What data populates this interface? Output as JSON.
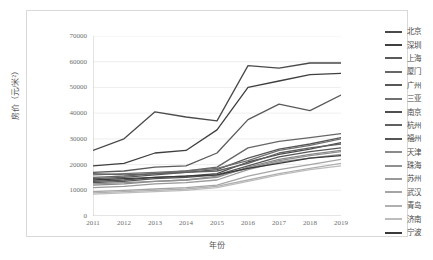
{
  "chart_data": {
    "type": "line",
    "title": "",
    "xlabel": "年份",
    "ylabel": "房价（元/米²）",
    "x": [
      "2011",
      "2012",
      "2013",
      "2014",
      "2015",
      "2016",
      "2017",
      "2018",
      "2019"
    ],
    "xlim": [
      2011,
      2019
    ],
    "ylim": [
      0,
      70000
    ],
    "ytick_labels": [
      "0",
      "10000",
      "20000",
      "30000",
      "40000",
      "50000",
      "60000",
      "70000"
    ],
    "ytick_values": [
      0,
      10000,
      20000,
      30000,
      40000,
      50000,
      60000,
      70000
    ],
    "grid": "horizontal",
    "legend_position": "right",
    "series": [
      {
        "name": "北京",
        "color": "#4a4a4a",
        "values": [
          25500,
          30000,
          40500,
          38500,
          37000,
          58500,
          57500,
          59500,
          59500
        ]
      },
      {
        "name": "深圳",
        "color": "#3f3f3f",
        "values": [
          19500,
          20500,
          24500,
          25500,
          33500,
          50000,
          52500,
          55000,
          55500
        ]
      },
      {
        "name": "上海",
        "color": "#5a5a5a",
        "values": [
          17000,
          17500,
          19000,
          19500,
          24500,
          37500,
          43500,
          41000,
          47000
        ]
      },
      {
        "name": "厦门",
        "color": "#666666",
        "values": [
          15000,
          15500,
          16500,
          17500,
          19000,
          26500,
          29000,
          30500,
          32000
        ]
      },
      {
        "name": "广州",
        "color": "#585858",
        "values": [
          14500,
          15000,
          16000,
          17000,
          18000,
          22500,
          26000,
          28000,
          30500
        ]
      },
      {
        "name": "三亚",
        "color": "#707070",
        "values": [
          16000,
          16500,
          17000,
          17500,
          18500,
          21500,
          25500,
          27500,
          30000
        ]
      },
      {
        "name": "南京",
        "color": "#4f4f4f",
        "values": [
          13500,
          14000,
          15000,
          15500,
          16500,
          21000,
          24000,
          26000,
          28500
        ]
      },
      {
        "name": "杭州",
        "color": "#606060",
        "values": [
          16500,
          16000,
          16500,
          17000,
          17500,
          20500,
          24500,
          26500,
          28000
        ]
      },
      {
        "name": "福州",
        "color": "#555555",
        "values": [
          13000,
          13500,
          14500,
          15000,
          16000,
          19500,
          23000,
          25000,
          26500
        ]
      },
      {
        "name": "天津",
        "color": "#8a8a8a",
        "values": [
          12000,
          12500,
          13500,
          14000,
          15000,
          19000,
          22000,
          24000,
          25500
        ]
      },
      {
        "name": "珠海",
        "color": "#909090",
        "values": [
          12500,
          13000,
          13500,
          14000,
          15500,
          18500,
          21500,
          23500,
          25000
        ]
      },
      {
        "name": "苏州",
        "color": "#999999",
        "values": [
          11000,
          11500,
          12500,
          13000,
          14000,
          18000,
          21000,
          22500,
          24000
        ]
      },
      {
        "name": "武汉",
        "color": "#a5a5a5",
        "values": [
          9500,
          10000,
          10500,
          11000,
          12000,
          15500,
          18000,
          20000,
          22000
        ]
      },
      {
        "name": "青岛",
        "color": "#b0b0b0",
        "values": [
          9000,
          9500,
          10000,
          10500,
          11500,
          14000,
          16500,
          18500,
          20500
        ]
      },
      {
        "name": "济南",
        "color": "#bdbdbd",
        "values": [
          8500,
          9000,
          9500,
          10000,
          11000,
          13500,
          16000,
          18000,
          19500
        ]
      },
      {
        "name": "宁波",
        "color": "#3a3a3a",
        "values": [
          14000,
          14500,
          15000,
          15500,
          16000,
          18500,
          20500,
          22500,
          23500
        ]
      }
    ]
  }
}
